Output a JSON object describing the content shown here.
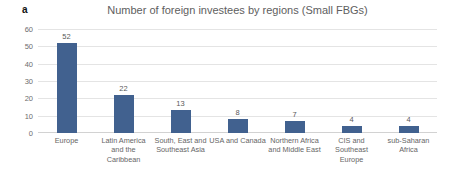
{
  "panel": {
    "letter": "a"
  },
  "chart_data": {
    "type": "bar",
    "title": "Number of foreign investees by regions (Small FBGs)",
    "xlabel": "",
    "ylabel": "",
    "categories": [
      "Europe",
      "Latin America and the Caribbean",
      "South, East and Southeast Asia",
      "USA and Canada",
      "Northern Africa and Middle East",
      "CIS and Southeast Europe",
      "sub-Saharan Africa"
    ],
    "values": [
      52,
      22,
      13,
      8,
      7,
      4,
      4
    ],
    "value_labels": [
      "52",
      "22",
      "13",
      "8",
      "7",
      "4",
      "4"
    ],
    "ylim": [
      0,
      60
    ],
    "yticks": [
      0,
      10,
      20,
      30,
      40,
      50,
      60
    ],
    "ytick_labels": [
      "0",
      "10",
      "20",
      "30",
      "40",
      "50",
      "60"
    ],
    "grid": true,
    "legend": false,
    "bar_color": "#41618f",
    "title_color": "#5e5e5e",
    "gridline_color": "#e4e4e4",
    "background": "#ffffff"
  }
}
